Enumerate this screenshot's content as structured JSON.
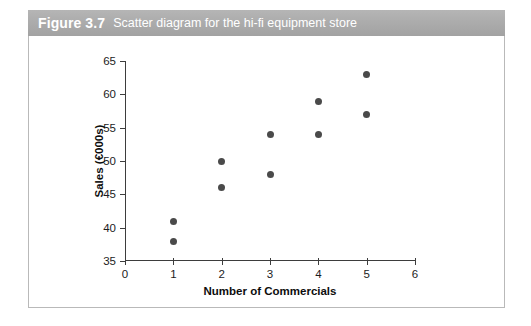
{
  "figure": {
    "number_label": "Figure 3.7",
    "caption": "Scatter diagram for the hi-fi equipment store"
  },
  "colors": {
    "caption_bar": "#ababab",
    "caption_text": "#ffffff",
    "point": "#4a4a4a",
    "axis": "#3d3d3d",
    "frame_border": "#b9b9b9",
    "background": "#ffffff"
  },
  "chart_data": {
    "type": "scatter",
    "title": "Scatter diagram for the hi-fi equipment store",
    "xlabel": "Number of Commercials",
    "ylabel": "Sales (€000s)",
    "xlim": [
      0,
      6
    ],
    "ylim": [
      35,
      65
    ],
    "xticks": [
      0,
      1,
      2,
      3,
      4,
      5,
      6
    ],
    "xticklabels": [
      "0",
      "1",
      "2",
      "3",
      "4",
      "5",
      "6"
    ],
    "yticks": [
      35,
      40,
      45,
      50,
      55,
      60,
      65
    ],
    "yticklabels": [
      "35",
      "40",
      "45",
      "50",
      "55",
      "60",
      "65"
    ],
    "grid": false,
    "legend": null,
    "x": [
      1,
      1,
      2,
      2,
      3,
      3,
      4,
      4,
      5,
      5
    ],
    "y": [
      41,
      38,
      50,
      46,
      54,
      48,
      59,
      54,
      63,
      57
    ],
    "points": [
      {
        "x": 1,
        "y": 41
      },
      {
        "x": 1,
        "y": 38
      },
      {
        "x": 2,
        "y": 50
      },
      {
        "x": 2,
        "y": 46
      },
      {
        "x": 3,
        "y": 54
      },
      {
        "x": 3,
        "y": 48
      },
      {
        "x": 4,
        "y": 59
      },
      {
        "x": 4,
        "y": 54
      },
      {
        "x": 5,
        "y": 63
      },
      {
        "x": 5,
        "y": 57
      }
    ]
  }
}
